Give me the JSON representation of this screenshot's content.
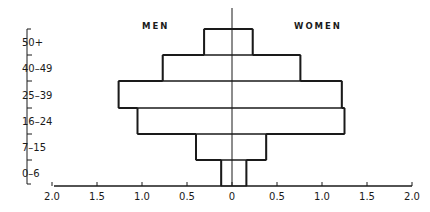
{
  "chart_data": {
    "type": "bar",
    "subtype": "population-pyramid",
    "title": "",
    "left_label": "MEN",
    "right_label": "WOMEN",
    "categories": [
      "50+",
      "40-49",
      "25-39",
      "16-24",
      "7-15",
      "0-6"
    ],
    "series": [
      {
        "name": "MEN",
        "values": [
          0.31,
          0.77,
          1.26,
          1.05,
          0.4,
          0.12
        ]
      },
      {
        "name": "WOMEN",
        "values": [
          0.23,
          0.76,
          1.22,
          1.25,
          0.38,
          0.16
        ]
      }
    ],
    "xlabel": "",
    "ylabel": "",
    "x_ticks": [
      "2.0",
      "1.5",
      "1.0",
      "0.5",
      "0",
      "0.5",
      "1.0",
      "1.5",
      "2.0"
    ],
    "xlim": [
      -2.0,
      2.0
    ],
    "grid": false,
    "legend": "none"
  },
  "labels": {
    "men": "MEN",
    "women": "WOMEN"
  }
}
